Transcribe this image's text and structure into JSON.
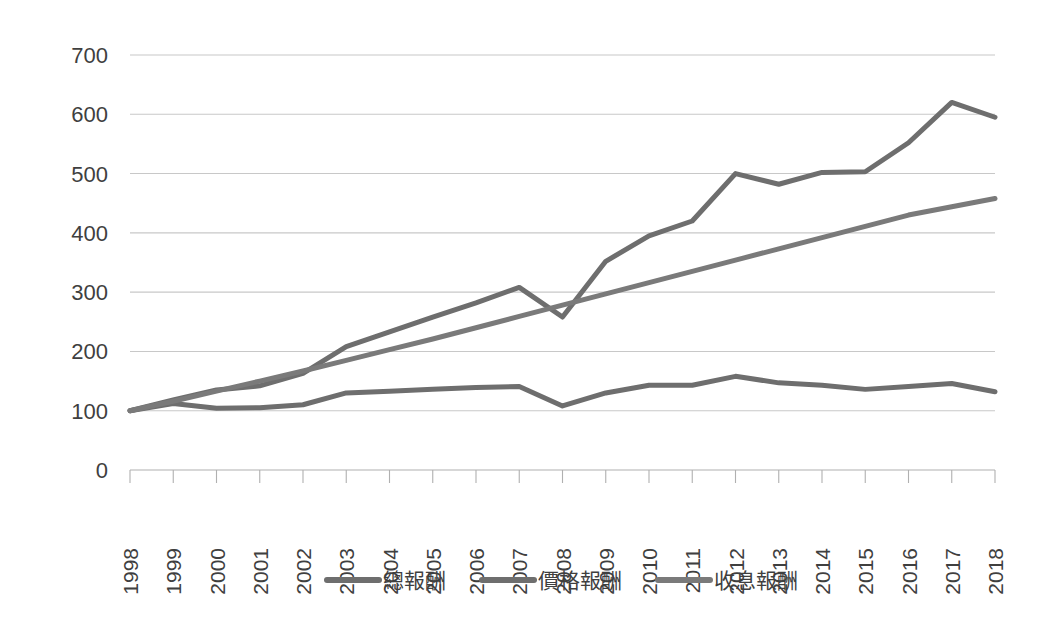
{
  "chart_data": {
    "type": "line",
    "title": "",
    "subtitle": "",
    "xlabel": "",
    "ylabel": "",
    "x": [
      "1998",
      "1999",
      "2000",
      "2001",
      "2002",
      "2003",
      "2004",
      "2005",
      "2006",
      "2007",
      "2008",
      "2009",
      "2010",
      "2011",
      "2012",
      "2013",
      "2014",
      "2015",
      "2016",
      "2017",
      "2018"
    ],
    "categories": [
      "1998",
      "1999",
      "2000",
      "2001",
      "2002",
      "2003",
      "2004",
      "2005",
      "2006",
      "2007",
      "2008",
      "2009",
      "2010",
      "2011",
      "2012",
      "2013",
      "2014",
      "2015",
      "2016",
      "2017",
      "2018"
    ],
    "ylim": [
      0,
      700
    ],
    "yticks": [
      0,
      100,
      200,
      300,
      400,
      500,
      600,
      700
    ],
    "ytick_labels": [
      "0",
      "100",
      "200",
      "300",
      "400",
      "500",
      "600",
      "700"
    ],
    "grid": true,
    "legend_position": "bottom",
    "series": [
      {
        "name": "總報酬",
        "color": "#6e6e6e",
        "values": [
          100,
          118,
          135,
          142,
          163,
          208,
          233,
          258,
          282,
          308,
          258,
          352,
          395,
          420,
          500,
          482,
          502,
          503,
          552,
          620,
          595
        ]
      },
      {
        "name": "價格報酬",
        "color": "#6e6e6e",
        "values": [
          100,
          112,
          104,
          105,
          110,
          130,
          133,
          136,
          139,
          141,
          108,
          130,
          143,
          143,
          158,
          147,
          143,
          136,
          141,
          146,
          132
        ]
      },
      {
        "name": "收息報酬",
        "color": "#7a7a7a",
        "values": [
          100,
          116,
          133,
          150,
          167,
          185,
          203,
          221,
          240,
          259,
          278,
          297,
          316,
          335,
          354,
          373,
          392,
          411,
          430,
          444,
          458
        ]
      }
    ]
  },
  "axes": {
    "y_axis_name": "value-axis",
    "x_axis_name": "year-axis"
  },
  "legend": {
    "items": [
      {
        "label": "總報酬",
        "color": "#6e6e6e"
      },
      {
        "label": "價格報酬",
        "color": "#6e6e6e"
      },
      {
        "label": "收息報酬",
        "color": "#7a7a7a"
      }
    ]
  },
  "style": {
    "background": "#ffffff",
    "gridline_color": "#c8c8c8",
    "axis_color": "#b0b0b0",
    "text_color": "#3f3f3f"
  }
}
